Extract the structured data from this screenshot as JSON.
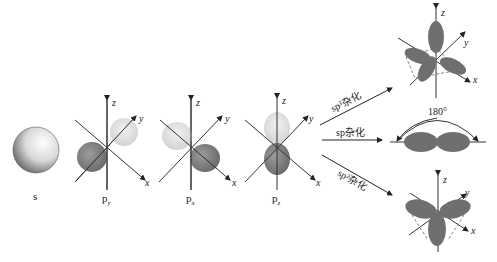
{
  "orbitals": [
    {
      "id": "s",
      "label": "s",
      "sub": ""
    },
    {
      "id": "py",
      "label": "p",
      "sub": "y"
    },
    {
      "id": "px",
      "label": "p",
      "sub": "x"
    },
    {
      "id": "pz",
      "label": "p",
      "sub": "z"
    }
  ],
  "axes": {
    "x": "x",
    "y": "y",
    "z": "z"
  },
  "hybridizations": [
    {
      "id": "sp3",
      "label": "sp³杂化"
    },
    {
      "id": "sp",
      "label": "sp杂化",
      "angle": "180°"
    },
    {
      "id": "sp2",
      "label": "sp²杂化"
    }
  ],
  "colors": {
    "dark_lobe": "#5a5a5a",
    "light_lobe": "#d6d6d6",
    "hybrid_lobe": "#6f6f6f",
    "axis": "#333333"
  }
}
